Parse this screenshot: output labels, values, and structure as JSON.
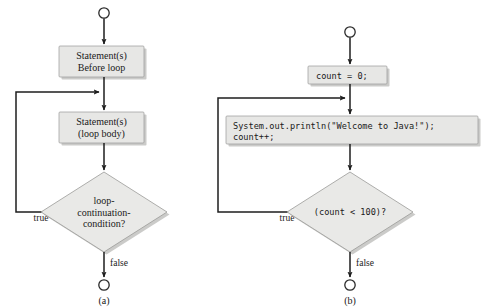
{
  "figure": {
    "background_color": "#ffffff",
    "shape_fill": "#e7e7e5",
    "shape_stroke": "#9a9a98",
    "line_color": "#1e1e1e"
  },
  "panel_a": {
    "caption": "(a)",
    "start_terminator": "start-circle",
    "box_before_loop": {
      "line1": "Statement(s)",
      "line2": "Before loop"
    },
    "box_loop_body": {
      "line1": "Statement(s)",
      "line2": "(loop body)"
    },
    "decision": {
      "line1": "loop-",
      "line2": "continuation-",
      "line3": "condition?"
    },
    "edge_true": "true",
    "edge_false": "false",
    "end_terminator": "end-circle"
  },
  "panel_b": {
    "caption": "(b)",
    "start_terminator": "start-circle",
    "box_init": {
      "line1": "count = 0;"
    },
    "box_loop_body": {
      "line1": "System.out.println(\"Welcome to Java!\");",
      "line2": "count++;"
    },
    "decision": {
      "line1": "(count < 100)?"
    },
    "edge_true": "true",
    "edge_false": "false",
    "end_terminator": "end-circle"
  }
}
